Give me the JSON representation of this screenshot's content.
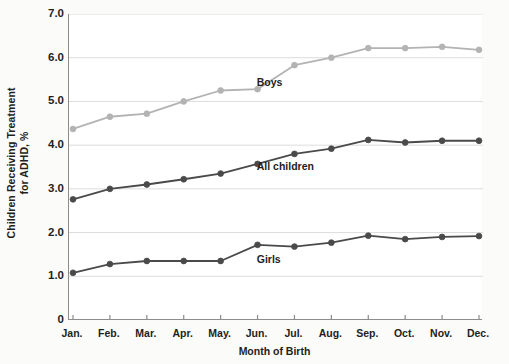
{
  "chart_data": {
    "type": "line",
    "title": "",
    "xlabel": "Month of Birth",
    "ylabel": "Children Receiving Treatment for ADHD, %",
    "ylabel_line1": "Children Receiving Treatment",
    "ylabel_line2": "for ADHD, %",
    "categories": [
      "Jan.",
      "Feb.",
      "Mar.",
      "Apr.",
      "May.",
      "Jun.",
      "Jul.",
      "Aug.",
      "Sep.",
      "Oct.",
      "Nov.",
      "Dec."
    ],
    "x": [
      "Jan.",
      "Feb.",
      "Mar.",
      "Apr.",
      "May.",
      "Jun.",
      "Jul.",
      "Aug.",
      "Sep.",
      "Oct.",
      "Nov.",
      "Dec."
    ],
    "ylim": [
      0,
      7.0
    ],
    "yticks": [
      "0",
      "1.0",
      "2.0",
      "3.0",
      "4.0",
      "5.0",
      "6.0",
      "7.0"
    ],
    "ytick_values": [
      0,
      1.0,
      2.0,
      3.0,
      4.0,
      5.0,
      6.0,
      7.0
    ],
    "grid": true,
    "grid_axis": "y",
    "legend": "inline-annotations",
    "series": [
      {
        "name": "Boys",
        "color": "#b3b3b3",
        "values": [
          4.37,
          4.65,
          4.72,
          5.0,
          5.25,
          5.28,
          5.83,
          6.0,
          6.22,
          6.22,
          6.25,
          6.18
        ]
      },
      {
        "name": "All children",
        "color": "#4a4a4a",
        "values": [
          2.76,
          3.0,
          3.1,
          3.22,
          3.35,
          3.57,
          3.8,
          3.92,
          4.12,
          4.06,
          4.1,
          4.1
        ]
      },
      {
        "name": "Girls",
        "color": "#4a4a4a",
        "values": [
          1.08,
          1.28,
          1.35,
          1.35,
          1.35,
          1.72,
          1.68,
          1.77,
          1.93,
          1.85,
          1.9,
          1.92
        ]
      }
    ],
    "annotations": [
      {
        "text": "Boys",
        "series": "Boys",
        "x_frac": 0.455,
        "y_value": 5.45
      },
      {
        "text": "All children",
        "series": "All children",
        "x_frac": 0.455,
        "y_value": 3.52
      },
      {
        "text": "Girls",
        "series": "Girls",
        "x_frac": 0.455,
        "y_value": 1.4
      }
    ]
  },
  "colors": {
    "background": "#fbfbfa",
    "plot_background": "#ffffff",
    "axis": "#8c8c8c",
    "grid": "#dcdcdc",
    "text": "#231f20",
    "boys": "#b3b3b3",
    "all_children": "#4a4a4a",
    "girls": "#4a4a4a"
  }
}
